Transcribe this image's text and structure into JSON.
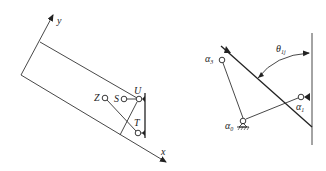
{
  "left_diagram": {
    "axes": {
      "x_label": "x",
      "y_label": "y"
    },
    "points": [
      {
        "id": "Z",
        "label": "Z"
      },
      {
        "id": "S",
        "label": "S"
      },
      {
        "id": "U",
        "label": "U"
      },
      {
        "id": "T",
        "label": "T"
      }
    ]
  },
  "right_diagram": {
    "points": [
      {
        "id": "alpha3",
        "label": "α",
        "sub": "3"
      },
      {
        "id": "alpha0",
        "label": "α",
        "sub": "0"
      },
      {
        "id": "alpha1",
        "label": "α",
        "sub": "1"
      }
    ],
    "angle_label": "θ",
    "angle_sub": "1j"
  },
  "colors": {
    "line": "#333333",
    "background": "#ffffff"
  }
}
